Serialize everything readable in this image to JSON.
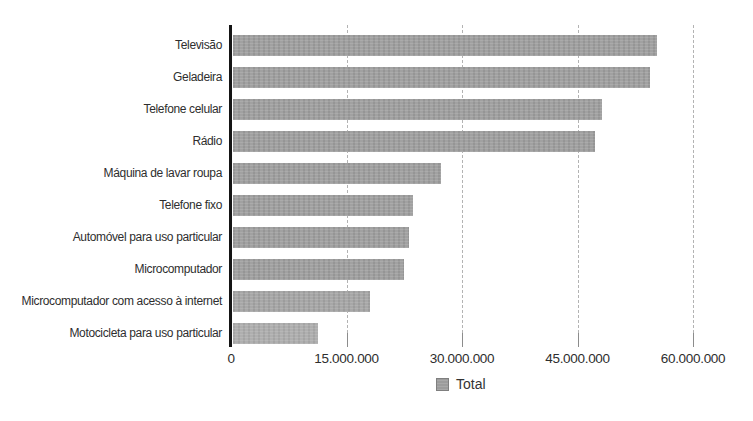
{
  "chart_data": {
    "type": "bar",
    "orientation": "horizontal",
    "title": "",
    "xlabel": "",
    "ylabel": "",
    "categories": [
      "Televisão",
      "Geladeira",
      "Telefone celular",
      "Rádio",
      "Máquina de lavar roupa",
      "Telefone fixo",
      "Automóvel para uso particular",
      "Microcomputador",
      "Microcomputador com acesso à internet",
      "Motocicleta para uso particular"
    ],
    "values": [
      55000000,
      54200000,
      47900000,
      47000000,
      27000000,
      23400000,
      22800000,
      22200000,
      17800000,
      11100000
    ],
    "series": [
      {
        "name": "Total",
        "values": [
          55000000,
          54200000,
          47900000,
          47000000,
          27000000,
          23400000,
          22800000,
          22200000,
          17800000,
          11100000
        ]
      }
    ],
    "xlim": [
      0,
      66000000
    ],
    "x_ticks": [
      0,
      15000000,
      30000000,
      45000000,
      60000000
    ],
    "x_tick_labels": [
      "0",
      "15.000.000",
      "30.000.000",
      "45.000.000",
      "60.000.000"
    ],
    "grid": "vertical-dashed",
    "legend_label": "Total",
    "legend_position": "bottom-center",
    "bar_color": "#9c9c9c",
    "bar_colors": [
      "#9c9c9c",
      "#9c9c9c",
      "#9c9c9c",
      "#9c9c9c",
      "#9c9c9c",
      "#9c9c9c",
      "#9c9c9c",
      "#9c9c9c",
      "#a3a3a3",
      "#ababab"
    ],
    "axis_color": "#151515",
    "gridline_color": "#b3b3b3",
    "label_color": "#2e2e2e"
  }
}
